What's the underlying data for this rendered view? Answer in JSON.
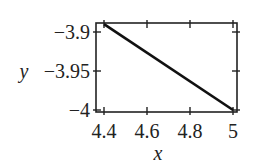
{
  "chart_data": {
    "type": "line",
    "title": "",
    "xlabel": "x",
    "ylabel": "y",
    "xlim": [
      4.37,
      5.01
    ],
    "ylim": [
      -4.0,
      -3.885
    ],
    "xticks": [
      4.4,
      4.6,
      4.8,
      5
    ],
    "xtick_labels": [
      "4.4",
      "4.6",
      "4.8",
      "5"
    ],
    "yticks": [
      -3.9,
      -3.95,
      -4
    ],
    "ytick_labels": [
      "−3.9",
      "−3.95",
      "−4"
    ],
    "grid": false,
    "legend": null,
    "series": [
      {
        "name": "y",
        "x": [
          4.4,
          5.0
        ],
        "y": [
          -3.89,
          -4.0
        ],
        "color": "#111111"
      }
    ]
  }
}
